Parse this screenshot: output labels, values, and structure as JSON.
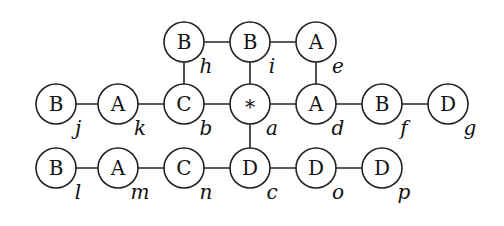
{
  "diagram": {
    "type": "graph",
    "radius": 20,
    "nodes": [
      {
        "id": "h",
        "symbol": "B",
        "label": "h",
        "x": 184,
        "y": 42
      },
      {
        "id": "i",
        "symbol": "B",
        "label": "i",
        "x": 250,
        "y": 42
      },
      {
        "id": "e",
        "symbol": "A",
        "label": "e",
        "x": 316,
        "y": 42
      },
      {
        "id": "j",
        "symbol": "B",
        "label": "j",
        "x": 56,
        "y": 104
      },
      {
        "id": "k",
        "symbol": "A",
        "label": "k",
        "x": 118,
        "y": 104
      },
      {
        "id": "b",
        "symbol": "C",
        "label": "b",
        "x": 184,
        "y": 104
      },
      {
        "id": "a",
        "symbol": "*",
        "label": "a",
        "x": 250,
        "y": 104
      },
      {
        "id": "d",
        "symbol": "A",
        "label": "d",
        "x": 316,
        "y": 104
      },
      {
        "id": "f",
        "symbol": "B",
        "label": "f",
        "x": 382,
        "y": 104
      },
      {
        "id": "g",
        "symbol": "D",
        "label": "g",
        "x": 448,
        "y": 104
      },
      {
        "id": "l",
        "symbol": "B",
        "label": "l",
        "x": 56,
        "y": 168
      },
      {
        "id": "m",
        "symbol": "A",
        "label": "m",
        "x": 118,
        "y": 168
      },
      {
        "id": "n",
        "symbol": "C",
        "label": "n",
        "x": 184,
        "y": 168
      },
      {
        "id": "c",
        "symbol": "D",
        "label": "c",
        "x": 250,
        "y": 168
      },
      {
        "id": "o",
        "symbol": "D",
        "label": "o",
        "x": 316,
        "y": 168
      },
      {
        "id": "p",
        "symbol": "D",
        "label": "p",
        "x": 382,
        "y": 168
      }
    ],
    "edges": [
      [
        "h",
        "i"
      ],
      [
        "i",
        "e"
      ],
      [
        "h",
        "b"
      ],
      [
        "i",
        "a"
      ],
      [
        "e",
        "d"
      ],
      [
        "j",
        "k"
      ],
      [
        "k",
        "b"
      ],
      [
        "b",
        "a"
      ],
      [
        "a",
        "d"
      ],
      [
        "d",
        "f"
      ],
      [
        "f",
        "g"
      ],
      [
        "a",
        "c"
      ],
      [
        "l",
        "m"
      ],
      [
        "m",
        "n"
      ],
      [
        "n",
        "c"
      ],
      [
        "c",
        "o"
      ],
      [
        "o",
        "p"
      ]
    ]
  }
}
